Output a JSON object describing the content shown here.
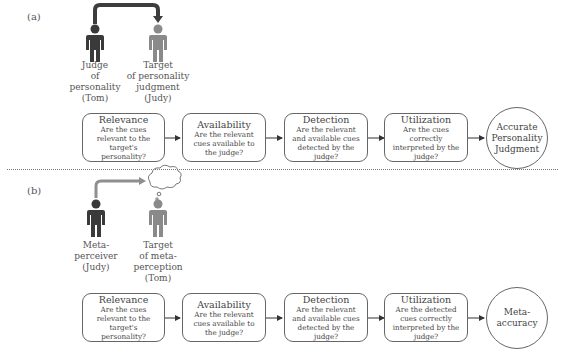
{
  "panel_a": {
    "label": "(a)",
    "judge": {
      "lines": [
        "Judge",
        "of",
        "personality",
        "(Tom)"
      ]
    },
    "target": {
      "lines": [
        "Target",
        "of personality",
        "judgment",
        "(Judy)"
      ]
    },
    "stages": [
      {
        "title": "Relevance",
        "desc": "Are the cues relevant to the target's personality?"
      },
      {
        "title": "Availability",
        "desc": "Are the relevant cues available to the judge?"
      },
      {
        "title": "Detection",
        "desc": "Are the relevant and available cues detected by the judge?"
      },
      {
        "title": "Utilization",
        "desc": "Are the cues correctly interpreted by the judge?"
      }
    ],
    "outcome": "Accurate Personality Judgment"
  },
  "panel_b": {
    "label": "(b)",
    "judge": {
      "lines": [
        "Meta-",
        "perceiver",
        "(Judy)"
      ]
    },
    "target": {
      "lines": [
        "Target",
        "of meta-",
        "perception",
        "(Tom)"
      ]
    },
    "stages": [
      {
        "title": "Relevance",
        "desc": "Are the cues relevant to the target's personality?"
      },
      {
        "title": "Availability",
        "desc": "Are the relevant cues available to the judge?"
      },
      {
        "title": "Detection",
        "desc": "Are the relevant and available cues detected by the judge?"
      },
      {
        "title": "Utilization",
        "desc": "Are the detected cues correctly interpreted by the judge?"
      }
    ],
    "outcome": "Meta-accuracy"
  },
  "colors": {
    "judge": "#3a3a3a",
    "target": "#8a8a8a",
    "arrow_a": "#3d3d3d",
    "arrow_b": "#8f8f8f"
  }
}
